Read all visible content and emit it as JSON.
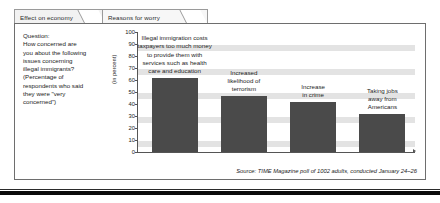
{
  "tabs": [
    {
      "id": "effect-on-economy",
      "label": "Effect on economy",
      "active": false
    },
    {
      "id": "reasons-for-worry",
      "label": "Reasons for worry",
      "active": true
    }
  ],
  "question": {
    "lines": [
      "Question:",
      "How concerned are",
      "you about the following",
      "issues concerning",
      "illegal immigrants?",
      "(Percentage of",
      "respondents who said",
      "they were \"very",
      "concerned\")"
    ]
  },
  "source": {
    "text": "Source: TIME Magazine poll of 1002 adults, conducted January 24–26"
  },
  "colors": {
    "bar": "#4a4a4a",
    "band": "#e3e3e3",
    "axis": "#555555",
    "panel_border": "#6e6e6e",
    "tab_border": "#9a9a9a",
    "tab_fill": "#f2f2f2"
  },
  "chart_data": {
    "type": "bar",
    "title": "",
    "xlabel": "",
    "ylabel": "(in percent)",
    "ylim": [
      0,
      100
    ],
    "yticks": [
      100,
      90,
      80,
      70,
      60,
      50,
      40,
      30,
      20,
      10,
      0
    ],
    "grid": "horizontal-bands",
    "legend": "none",
    "categories": [
      "Illegal immigration costs taxpayers too much money to provide them with services such as health care and education",
      "Increased likelihood of terrorism",
      "Increase in crime",
      "Taking jobs away from Americans"
    ],
    "category_label_lines": [
      [
        "Illegal immigration costs",
        "taxpayers too much money",
        "to provide them with",
        "services such as health",
        "care and education"
      ],
      [
        "Increased",
        "likelihood of",
        "terrorism"
      ],
      [
        "Increase",
        "in crime"
      ],
      [
        "Taking jobs",
        "away from",
        "Americans"
      ]
    ],
    "values": [
      62,
      47,
      42,
      32
    ]
  }
}
